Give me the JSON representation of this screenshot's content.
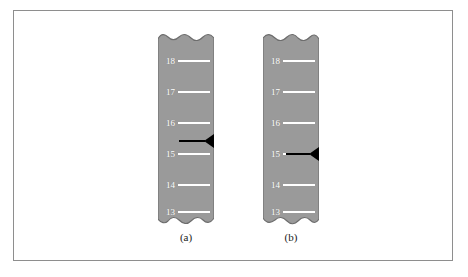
{
  "figure": {
    "type": "gel-electrophoresis-autoradiograph",
    "frame": {
      "border_color": "#8e8e8e",
      "background_color": "#ffffff"
    },
    "strip": {
      "fill_color": "#9a9a9a",
      "edge_color": "#6d6d6d",
      "marker_color": "#ffffff",
      "band_color": "#000000",
      "top_edge": "torn-wavy",
      "bottom_edge": "torn-wavy"
    },
    "marker_ladder": [
      "18",
      "17",
      "16",
      "15",
      "14",
      "13"
    ],
    "panels": [
      {
        "id": "a",
        "caption": "(a)",
        "markers": [
          {
            "label": "18"
          },
          {
            "label": "17"
          },
          {
            "label": "16"
          },
          {
            "label": "15"
          },
          {
            "label": "14"
          },
          {
            "label": "13"
          }
        ],
        "band": {
          "position_label": "between 16 and 15",
          "visible": true
        }
      },
      {
        "id": "b",
        "caption": "(b)",
        "markers": [
          {
            "label": "18"
          },
          {
            "label": "17"
          },
          {
            "label": "16"
          },
          {
            "label": "15"
          },
          {
            "label": "14"
          },
          {
            "label": "13"
          }
        ],
        "band": {
          "position_label": "at 15",
          "visible": true
        }
      }
    ]
  }
}
